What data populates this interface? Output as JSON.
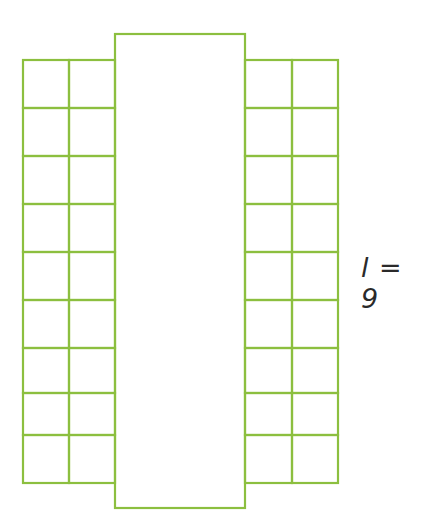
{
  "figure": {
    "label": "l = 9",
    "grid": {
      "rows_per_side": 9,
      "cols_per_side": 2
    },
    "line_color": "#8cbf3f"
  }
}
